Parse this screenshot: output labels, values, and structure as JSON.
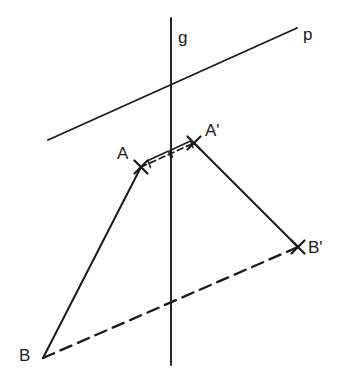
{
  "figure": {
    "width": 344,
    "height": 391,
    "background_color": "#ffffff",
    "ink_color": "#1a1a1a"
  },
  "labels": {
    "line_g": "g",
    "line_p": "p",
    "point_a": "A",
    "point_a_prime": "A'",
    "point_b": "B",
    "point_b_prime": "B'"
  },
  "label_positions": {
    "line_g": {
      "x": 178,
      "y": 29
    },
    "line_p": {
      "x": 303,
      "y": 26
    },
    "point_a": {
      "x": 117,
      "y": 145
    },
    "point_a_prime": {
      "x": 205,
      "y": 122
    },
    "point_b": {
      "x": 19,
      "y": 347
    },
    "point_b_prime": {
      "x": 308,
      "y": 239
    }
  },
  "points": {
    "A": {
      "x": 141,
      "y": 167
    },
    "A_prime": {
      "x": 194,
      "y": 143
    },
    "B": {
      "x": 43,
      "y": 358
    },
    "B_prime": {
      "x": 298,
      "y": 247
    },
    "g_top": {
      "x": 171,
      "y": 18
    },
    "g_bottom": {
      "x": 171,
      "y": 365
    },
    "p_left": {
      "x": 48,
      "y": 140
    },
    "p_right": {
      "x": 297,
      "y": 28
    },
    "p_g_intersection": {
      "x": 171,
      "y": 85
    },
    "aa_midpoint": {
      "x": 167,
      "y": 155
    }
  },
  "segments": {
    "line_p": {
      "style": "solid",
      "from": "p_left",
      "to": "p_right"
    },
    "line_g": {
      "style": "solid",
      "from": "g_top",
      "to": "g_bottom"
    },
    "A_to_B": {
      "style": "solid",
      "from": "A",
      "to": "B"
    },
    "Aprime_to_Bprime": {
      "style": "solid",
      "from": "A_prime",
      "to": "B_prime"
    },
    "B_to_Bprime": {
      "style": "dashed-long",
      "from": "B",
      "to": "B_prime"
    },
    "A_to_Aprime": {
      "style": "dashed-short",
      "from": "A",
      "to": "A_prime"
    }
  },
  "markers": {
    "x_marker_points": [
      "A",
      "A_prime",
      "B_prime"
    ],
    "congruence_ticks": 2
  }
}
